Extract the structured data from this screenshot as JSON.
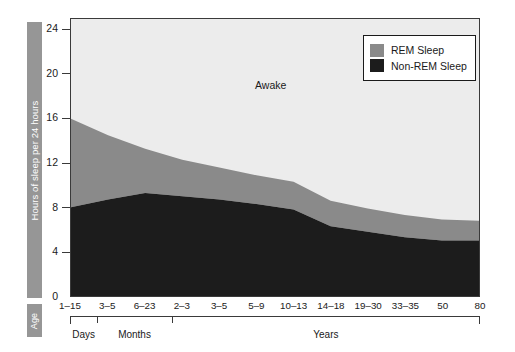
{
  "axes": {
    "y_title": "Hours of sleep per 24 hours",
    "x_title": "Age",
    "y_ticks": [
      "0",
      "4",
      "8",
      "12",
      "16",
      "20",
      "24"
    ]
  },
  "annotations": {
    "awake": "Awake"
  },
  "legend": {
    "items": [
      {
        "label": "REM Sleep",
        "color": "#8a8a8a",
        "icon": "rem-swatch"
      },
      {
        "label": "Non-REM Sleep",
        "color": "#1c1c1c",
        "icon": "nonrem-swatch"
      }
    ]
  },
  "groups": [
    {
      "label": "Days",
      "start_index": 0,
      "end_index": 0
    },
    {
      "label": "Months",
      "start_index": 1,
      "end_index": 2
    },
    {
      "label": "Years",
      "start_index": 3,
      "end_index": 10
    }
  ],
  "colors": {
    "awake": "#ececec",
    "rem": "#8a8a8a",
    "non_rem": "#1c1c1c",
    "axis": "#3a3a3a",
    "label_bar": "#969696",
    "label_bar_text": "#ffffff"
  },
  "chart_data": {
    "type": "area",
    "title": "",
    "subtitle": "",
    "xlabel": "Age",
    "ylabel": "Hours of sleep per 24 hours",
    "ylim": [
      0,
      25
    ],
    "xlim": [
      0,
      10
    ],
    "grid": false,
    "stacked": true,
    "legend_position": "top-right",
    "categories": [
      "1-15",
      "3-5",
      "6-23",
      "2-3",
      "3-5",
      "5-9",
      "10-13",
      "14-18",
      "19-30",
      "33-35",
      "50",
      "80"
    ],
    "tick_labels": [
      "1–15",
      "3–5",
      "6–23",
      "2–3",
      "3–5",
      "5–9",
      "10–13",
      "14–18",
      "19–30",
      "33–35",
      "50",
      "80"
    ],
    "series": [
      {
        "name": "Non-REM Sleep",
        "color": "#1c1c1c",
        "values": [
          8.0,
          8.7,
          9.3,
          9.0,
          8.7,
          8.3,
          7.8,
          6.3,
          5.8,
          5.3,
          5.0,
          5.0
        ]
      },
      {
        "name": "REM Sleep",
        "color": "#8a8a8a",
        "values": [
          8.0,
          5.8,
          4.0,
          3.3,
          2.9,
          2.6,
          2.5,
          2.3,
          2.1,
          2.0,
          1.9,
          1.8
        ]
      },
      {
        "name": "Awake",
        "color": "#ececec",
        "values": [
          9.0,
          10.5,
          11.7,
          12.7,
          13.4,
          14.1,
          14.7,
          16.4,
          17.1,
          17.7,
          18.1,
          18.2
        ]
      }
    ],
    "total_sleep": [
      16.0,
      14.5,
      13.3,
      12.3,
      11.6,
      10.9,
      10.3,
      8.6,
      7.9,
      7.3,
      6.9,
      6.8
    ],
    "annotations": [
      {
        "text": "Awake",
        "x_index": 5,
        "y": 20.5
      }
    ]
  }
}
